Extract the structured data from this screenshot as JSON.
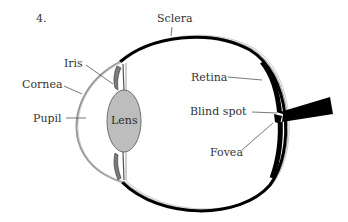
{
  "figure": {
    "number": "4."
  },
  "labels": {
    "sclera": "Sclera",
    "iris": "Iris",
    "cornea": "Cornea",
    "pupil": "Pupil",
    "lens": "Lens",
    "retina": "Retina",
    "blind_spot": "Blind spot",
    "fovea": "Fovea"
  },
  "colors": {
    "outline": "#000000",
    "cornea": "#9a9a9a",
    "lens_fill": "#bdbdbd",
    "lens_stroke": "#6f6f6f",
    "label_text": "#333333",
    "leader_line": "#555555",
    "background": "#ffffff"
  }
}
